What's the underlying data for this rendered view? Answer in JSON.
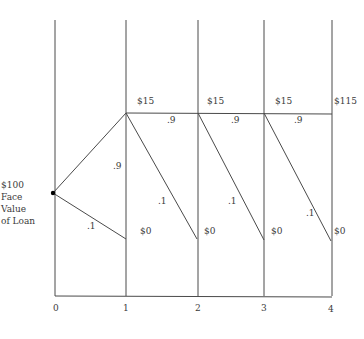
{
  "diagram": {
    "type": "binomial-loan-tree",
    "start": {
      "label_lines": [
        "$100",
        "Face",
        "Value",
        "of Loan"
      ]
    },
    "time_axis": {
      "ticks": [
        "0",
        "1",
        "2",
        "3",
        "4"
      ]
    },
    "payments": {
      "no_default": [
        "$15",
        "$15",
        "$15",
        "$115"
      ],
      "default": [
        "$0",
        "$0",
        "$0",
        "$0"
      ]
    },
    "probabilities": {
      "continue": [
        ".9",
        ".9",
        ".9",
        ".9"
      ],
      "default": [
        ".1",
        ".1",
        ".1",
        ".1"
      ]
    },
    "colors": {
      "line": "#4a4a4a",
      "node": "#000000",
      "text": "#3a3a3a"
    }
  }
}
